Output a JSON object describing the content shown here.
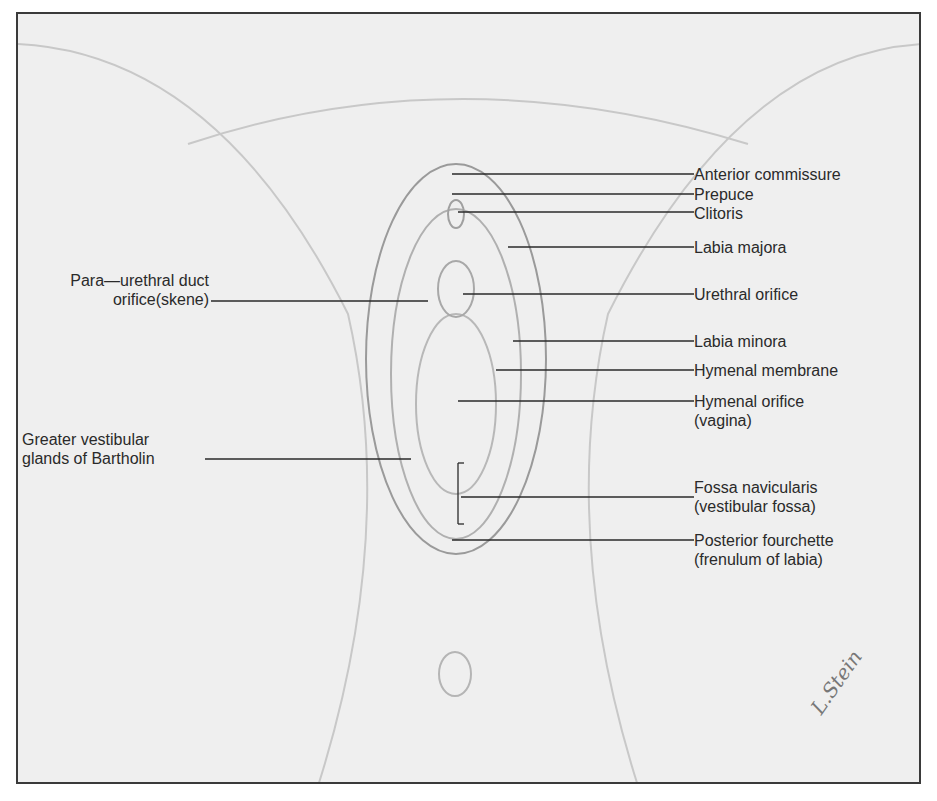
{
  "figure": {
    "signature": "L.Stein",
    "colors": {
      "background": "#efefef",
      "frame": "#3a3a3a",
      "text": "#2a2a2a",
      "leader": "#2a2a2a"
    }
  },
  "labels_right": [
    {
      "id": "anterior-commissure",
      "text": "Anterior commissure"
    },
    {
      "id": "prepuce",
      "text": "Prepuce"
    },
    {
      "id": "clitoris",
      "text": "Clitoris"
    },
    {
      "id": "labia-majora",
      "text": "Labia majora"
    },
    {
      "id": "urethral-orifice",
      "text": "Urethral orifice"
    },
    {
      "id": "labia-minora",
      "text": "Labia minora"
    },
    {
      "id": "hymenal-membrane",
      "text": "Hymenal membrane"
    },
    {
      "id": "hymenal-orifice",
      "text": "Hymenal orifice",
      "sub": "(vagina)"
    },
    {
      "id": "fossa-navicularis",
      "text": "Fossa navicularis",
      "sub": "(vestibular fossa)"
    },
    {
      "id": "posterior-fourchette",
      "text": "Posterior fourchette",
      "sub": "(frenulum of labia)"
    }
  ],
  "labels_left": [
    {
      "id": "para-urethral",
      "text": "Para—urethral duct",
      "sub": "orifice(skene)"
    },
    {
      "id": "bartholin",
      "text": "Greater vestibular",
      "sub": "glands of Bartholin"
    }
  ]
}
